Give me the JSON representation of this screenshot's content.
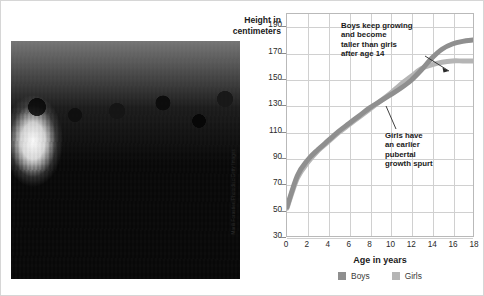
{
  "figure": {
    "photo": {
      "alt": "Group of teenage boys and girls standing together on a city street",
      "credit": "Marili Forastieri/Photodisc/Getty Images"
    }
  },
  "chart_data": {
    "type": "line",
    "title": "",
    "xlabel": "Age in years",
    "ylabel": "Height in centimeters",
    "x": [
      0,
      1,
      2,
      3,
      4,
      5,
      6,
      7,
      8,
      9,
      10,
      11,
      12,
      13,
      14,
      15,
      16,
      17,
      18
    ],
    "xlim": [
      0,
      18
    ],
    "ylim": [
      30,
      200
    ],
    "xticks": [
      "0",
      "2",
      "4",
      "6",
      "8",
      "10",
      "12",
      "14",
      "16",
      "18"
    ],
    "yticks": [
      "190",
      "170",
      "150",
      "130",
      "110",
      "90",
      "70",
      "50",
      "30"
    ],
    "grid": true,
    "legend_position": "bottom-center",
    "series": [
      {
        "name": "Boys",
        "color": "#8f8f8f",
        "values": [
          52,
          76,
          88,
          96,
          103,
          110,
          116,
          122,
          128,
          133,
          138,
          143,
          149,
          157,
          166,
          173,
          177,
          179,
          180
        ]
      },
      {
        "name": "Girls",
        "color": "#b5b5b5",
        "values": [
          51,
          74,
          86,
          95,
          102,
          109,
          115,
          121,
          127,
          133,
          139,
          146,
          152,
          158,
          161,
          163,
          164,
          164,
          164
        ]
      }
    ],
    "annotations": [
      {
        "id": "boys-annotation",
        "text": "Boys keep growing and become taller than girls after age 14",
        "lines": [
          "Boys keep growing",
          "and become",
          "taller than girls",
          "after age 14"
        ]
      },
      {
        "id": "girls-annotation",
        "text": "Girls have an earlier pubertal growth spurt",
        "lines": [
          "Girls have",
          "an earlier",
          "pubertal",
          "growth spurt"
        ]
      }
    ]
  }
}
